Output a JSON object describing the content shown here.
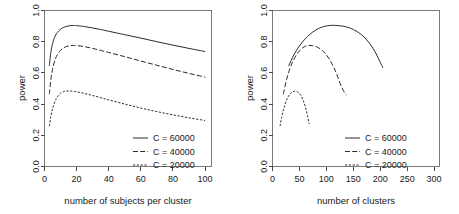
{
  "figure": {
    "background": "#ffffff",
    "ink": "#2b2b2b"
  },
  "chart_data": [
    {
      "type": "line",
      "title": "",
      "panel": "left",
      "xlabel": "number of subjects per cluster",
      "ylabel": "power",
      "xlim": [
        0,
        104
      ],
      "ylim": [
        0.0,
        1.0
      ],
      "xticks": [
        0,
        20,
        40,
        60,
        80,
        100
      ],
      "xticklabels": [
        "0",
        "20",
        "40",
        "60",
        "80",
        "100"
      ],
      "yticks": [
        0.0,
        0.2,
        0.4,
        0.6,
        0.8,
        1.0
      ],
      "yticklabels": [
        "0.0",
        "0.2",
        "0.4",
        "0.6",
        "0.8",
        "1.0"
      ],
      "grid": false,
      "legend_position": "bottom-right",
      "series": [
        {
          "name": "C = 60000",
          "style": "solid",
          "x": [
            3,
            4,
            5,
            6,
            7,
            8,
            10,
            12,
            14,
            16,
            18,
            20,
            25,
            30,
            35,
            40,
            50,
            60,
            70,
            80,
            90,
            100
          ],
          "values": [
            0.645,
            0.735,
            0.787,
            0.82,
            0.843,
            0.859,
            0.88,
            0.892,
            0.899,
            0.903,
            0.904,
            0.903,
            0.897,
            0.888,
            0.878,
            0.867,
            0.845,
            0.823,
            0.8,
            0.778,
            0.757,
            0.737
          ]
        },
        {
          "name": "C = 40000",
          "style": "dashed",
          "x": [
            3,
            4,
            5,
            6,
            7,
            8,
            10,
            12,
            14,
            16,
            18,
            20,
            25,
            30,
            35,
            40,
            50,
            60,
            70,
            80,
            90,
            100
          ],
          "values": [
            0.463,
            0.561,
            0.623,
            0.665,
            0.695,
            0.717,
            0.745,
            0.761,
            0.77,
            0.774,
            0.776,
            0.775,
            0.768,
            0.757,
            0.744,
            0.731,
            0.704,
            0.676,
            0.649,
            0.622,
            0.597,
            0.573
          ]
        },
        {
          "name": "C = 20000",
          "style": "dotted",
          "x": [
            3,
            4,
            5,
            6,
            7,
            8,
            10,
            12,
            14,
            16,
            18,
            20,
            25,
            30,
            35,
            40,
            50,
            60,
            70,
            80,
            90,
            100
          ],
          "values": [
            0.258,
            0.325,
            0.371,
            0.404,
            0.429,
            0.447,
            0.47,
            0.48,
            0.484,
            0.484,
            0.482,
            0.479,
            0.468,
            0.455,
            0.441,
            0.427,
            0.4,
            0.375,
            0.352,
            0.331,
            0.312,
            0.295
          ]
        }
      ]
    },
    {
      "type": "line",
      "title": "",
      "panel": "right",
      "xlabel": "number of clusters",
      "ylabel": "power",
      "xlim": [
        0,
        310
      ],
      "ylim": [
        0.0,
        1.0
      ],
      "xticks": [
        0,
        50,
        100,
        150,
        200,
        250,
        300
      ],
      "xticklabels": [
        "0",
        "50",
        "100",
        "150",
        "200",
        "250",
        "300"
      ],
      "yticks": [
        0.0,
        0.2,
        0.4,
        0.6,
        0.8,
        1.0
      ],
      "yticklabels": [
        "0.0",
        "0.2",
        "0.4",
        "0.6",
        "0.8",
        "1.0"
      ],
      "grid": false,
      "legend_position": "bottom-right",
      "series": [
        {
          "name": "C = 60000",
          "style": "solid",
          "x": [
            30,
            40,
            50,
            60,
            70,
            80,
            90,
            100,
            110,
            120,
            130,
            140,
            150,
            160,
            170,
            180,
            190,
            200,
            205
          ],
          "values": [
            0.645,
            0.718,
            0.773,
            0.816,
            0.849,
            0.874,
            0.891,
            0.901,
            0.905,
            0.904,
            0.9,
            0.892,
            0.878,
            0.858,
            0.83,
            0.79,
            0.738,
            0.668,
            0.633
          ]
        },
        {
          "name": "C = 40000",
          "style": "dashed",
          "x": [
            20,
            26,
            32,
            38,
            44,
            50,
            56,
            62,
            68,
            74,
            80,
            86,
            92,
            98,
            104,
            110,
            116,
            122,
            128,
            134,
            137
          ],
          "values": [
            0.463,
            0.556,
            0.625,
            0.676,
            0.714,
            0.742,
            0.761,
            0.772,
            0.776,
            0.775,
            0.77,
            0.76,
            0.745,
            0.724,
            0.696,
            0.661,
            0.618,
            0.566,
            0.512,
            0.472,
            0.46
          ]
        },
        {
          "name": "C = 20000",
          "style": "dotted",
          "x": [
            14,
            17,
            20,
            23,
            26,
            29,
            32,
            35,
            38,
            41,
            44,
            47,
            50,
            53,
            56,
            59,
            62,
            65,
            68
          ],
          "values": [
            0.258,
            0.315,
            0.36,
            0.396,
            0.425,
            0.447,
            0.463,
            0.474,
            0.48,
            0.483,
            0.482,
            0.477,
            0.468,
            0.453,
            0.432,
            0.404,
            0.369,
            0.326,
            0.272
          ]
        }
      ]
    }
  ],
  "legend": {
    "entries": [
      {
        "label": "C = 60000",
        "style": "solid"
      },
      {
        "label": "C = 40000",
        "style": "dashed"
      },
      {
        "label": "C = 20000",
        "style": "dotted"
      }
    ]
  }
}
